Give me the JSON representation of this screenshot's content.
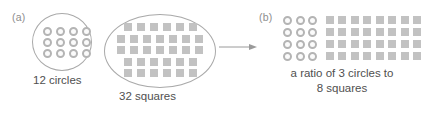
{
  "figure": {
    "panels": [
      {
        "letter": "(a)",
        "groups": [
          {
            "name": "circles-group",
            "shape": "circle-outline",
            "glyph": "circle",
            "count": 12,
            "columns": 4,
            "rows": 3,
            "label": "12 circles"
          },
          {
            "name": "squares-group",
            "shape": "oval-outline",
            "glyph": "square",
            "count": 32,
            "row_counts": [
              6,
              7,
              7,
              6,
              6
            ],
            "label": "32 squares"
          }
        ]
      },
      {
        "letter": "(b)",
        "ratio": {
          "rows": 4,
          "circles_per_row": 3,
          "squares_per_row": 8,
          "caption_line1": "a ratio of 3 circles to",
          "caption_line2": "8 squares"
        }
      }
    ],
    "arrow": {
      "name": "rightwards-arrow",
      "direction": "right"
    },
    "colors": {
      "outline": "#a9a9a9",
      "circle_stroke": "#b4b4b4",
      "circle_fill": "#fbfbfb",
      "square_fill": "#c2c2c2",
      "text": "#4f4f4f",
      "panel_letter": "#8d8d8d",
      "background": "#ffffff"
    }
  }
}
